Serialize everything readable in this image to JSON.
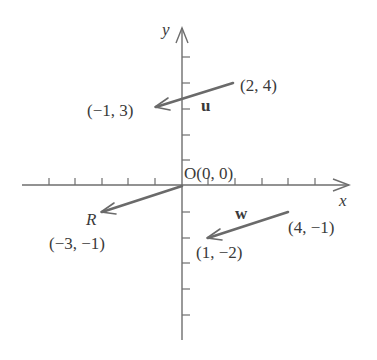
{
  "diagram": {
    "title": "",
    "axes": {
      "x_label": "x",
      "y_label": "y",
      "origin_label": "O(0, 0)",
      "unit_px": 26.5,
      "origin_px": [
        182,
        185
      ],
      "x_ticks": [
        -5,
        -4,
        -3,
        -2,
        -1,
        1,
        2,
        3,
        4,
        5
      ],
      "y_ticks": [
        5,
        4,
        3,
        2,
        1,
        -1,
        -2,
        -3,
        -4,
        -5
      ]
    },
    "vectors": [
      {
        "name": "u",
        "label": "u",
        "label_style": "bold",
        "tail": [
          2,
          4
        ],
        "head": [
          -1,
          3
        ],
        "tail_label": "(2, 4)",
        "head_label": "(−1, 3)"
      },
      {
        "name": "R",
        "label": "R",
        "label_style": "italic",
        "tail": [
          0,
          0
        ],
        "head": [
          -3,
          -1
        ],
        "head_label": "(−3, −1)"
      },
      {
        "name": "w",
        "label": "w",
        "label_style": "bold",
        "tail": [
          4,
          -1
        ],
        "head": [
          1,
          -2
        ],
        "tail_label": "(4, −1)",
        "head_label": "(1, −2)"
      }
    ],
    "colors": {
      "axis": "#6e6e6e",
      "vector": "#6a6a6a",
      "text": "#3a3a3a",
      "background": "#ffffff"
    }
  }
}
